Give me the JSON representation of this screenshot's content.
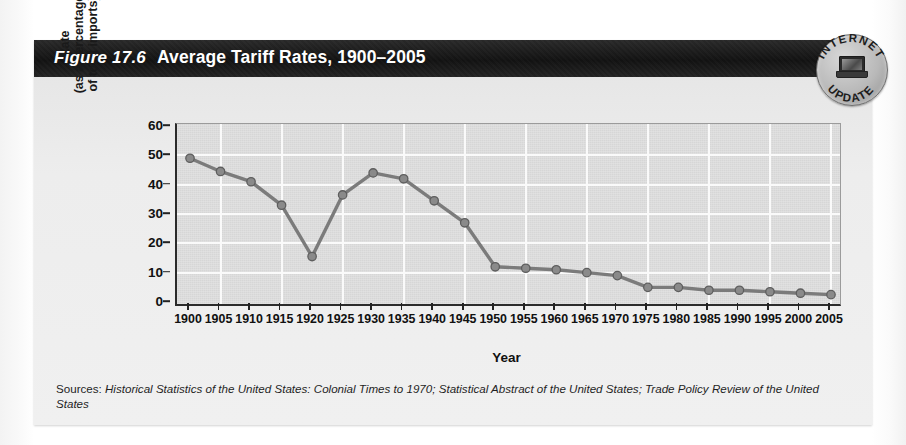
{
  "figure": {
    "number": "Figure 17.6",
    "title": "Average Tariff Rates, 1900–2005"
  },
  "badge": {
    "top_text": "INTERNET",
    "bottom_text": "UPDATE",
    "icon": "laptop-icon"
  },
  "sources": {
    "label": "Sources: ",
    "text": "Historical Statistics of the United States: Colonial Times to 1970; Statistical Abstract of the United States; Trade Policy Review of the United States"
  },
  "colors": {
    "header_band": "#121212",
    "plot_background": "#dcdcdc",
    "gridline": "#fafafa",
    "series_line": "#7b7b7b",
    "marker_fill": "#8a8a8a",
    "axis": "#2b2b2b"
  },
  "chart_data": {
    "type": "line",
    "title": "Average Tariff Rates, 1900–2005",
    "xlabel": "Year",
    "ylabel": "Rate (as a percentage of total imports)",
    "ylabel_lines": [
      "Rate",
      "(as a percentage",
      "of total imports)"
    ],
    "categories": [
      1900,
      1905,
      1910,
      1915,
      1920,
      1925,
      1930,
      1935,
      1940,
      1945,
      1950,
      1955,
      1960,
      1965,
      1970,
      1975,
      1980,
      1985,
      1990,
      1995,
      2000,
      2005
    ],
    "values": [
      49,
      44.5,
      41,
      33,
      15.5,
      36.5,
      44,
      42,
      34.5,
      27,
      12,
      11.5,
      11,
      10,
      9,
      5,
      5,
      4,
      4,
      3.5,
      3,
      2.5
    ],
    "xlim": [
      1900,
      2005
    ],
    "ylim": [
      0,
      60
    ],
    "yticks": [
      0,
      10,
      20,
      30,
      40,
      50,
      60
    ],
    "xticks": [
      1900,
      1905,
      1910,
      1915,
      1920,
      1925,
      1930,
      1935,
      1940,
      1945,
      1950,
      1955,
      1960,
      1965,
      1970,
      1975,
      1980,
      1985,
      1990,
      1995,
      2000,
      2005
    ],
    "grid": true,
    "legend": "none",
    "marker": "circle"
  }
}
